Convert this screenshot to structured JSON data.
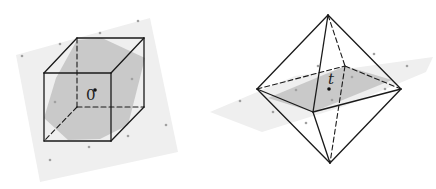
{
  "figure": {
    "width": 436,
    "height": 189,
    "colors": {
      "edge": "#1a1a1a",
      "plane": "#efefef",
      "section": "#c4c4c4",
      "lattice_point": "#a0a0a0",
      "center_point": "#111111"
    },
    "cube": {
      "label": "0",
      "label_pos": [
        86,
        100
      ],
      "center": [
        95,
        90
      ],
      "plane_polygon": [
        [
          16,
          55
        ],
        [
          150,
          18
        ],
        [
          178,
          152
        ],
        [
          40,
          182
        ]
      ],
      "section_polygon": [
        [
          77,
          40
        ],
        [
          102,
          38
        ],
        [
          145,
          58
        ],
        [
          128,
          125
        ],
        [
          100,
          139
        ],
        [
          68,
          140
        ],
        [
          44,
          118
        ],
        [
          56,
          78
        ]
      ],
      "solid_edges": [
        [
          [
            44,
            73
          ],
          [
            111,
            73
          ]
        ],
        [
          [
            111,
            73
          ],
          [
            111,
            141
          ]
        ],
        [
          [
            111,
            141
          ],
          [
            44,
            141
          ]
        ],
        [
          [
            44,
            141
          ],
          [
            44,
            73
          ]
        ],
        [
          [
            77,
            38
          ],
          [
            144,
            38
          ]
        ],
        [
          [
            144,
            38
          ],
          [
            144,
            107
          ]
        ],
        [
          [
            44,
            73
          ],
          [
            77,
            38
          ]
        ],
        [
          [
            111,
            73
          ],
          [
            144,
            38
          ]
        ],
        [
          [
            111,
            141
          ],
          [
            144,
            107
          ]
        ]
      ],
      "dashed_edges": [
        [
          [
            77,
            38
          ],
          [
            77,
            107
          ]
        ],
        [
          [
            77,
            107
          ],
          [
            144,
            107
          ]
        ],
        [
          [
            77,
            107
          ],
          [
            44,
            141
          ]
        ]
      ],
      "lattice_points": [
        [
          22,
          56
        ],
        [
          100,
          33
        ],
        [
          138,
          21
        ],
        [
          60,
          44
        ],
        [
          132,
          79
        ],
        [
          55,
          102
        ],
        [
          166,
          125
        ],
        [
          128,
          136
        ],
        [
          89,
          147
        ],
        [
          50,
          160
        ]
      ]
    },
    "octahedron": {
      "label": "t",
      "label_pos": [
        328,
        84
      ],
      "center": [
        329,
        89
      ],
      "plane_polygon": [
        [
          210,
          112
        ],
        [
          295,
          76
        ],
        [
          433,
          57
        ],
        [
          426,
          72
        ],
        [
          345,
          106
        ],
        [
          262,
          132
        ]
      ],
      "section_polygon": [
        [
          268,
          98
        ],
        [
          345,
          66
        ],
        [
          392,
          80
        ],
        [
          313,
          112
        ]
      ],
      "vertices": {
        "top": [
          328,
          15
        ],
        "bottom": [
          330,
          163
        ],
        "left": [
          257,
          89
        ],
        "right": [
          401,
          89
        ],
        "front": [
          313,
          112
        ],
        "back": [
          345,
          66
        ]
      },
      "solid_edges": [
        [
          [
            328,
            15
          ],
          [
            257,
            89
          ]
        ],
        [
          [
            328,
            15
          ],
          [
            401,
            89
          ]
        ],
        [
          [
            328,
            15
          ],
          [
            313,
            112
          ]
        ],
        [
          [
            330,
            163
          ],
          [
            257,
            89
          ]
        ],
        [
          [
            330,
            163
          ],
          [
            401,
            89
          ]
        ],
        [
          [
            330,
            163
          ],
          [
            313,
            112
          ]
        ],
        [
          [
            257,
            89
          ],
          [
            313,
            112
          ]
        ],
        [
          [
            313,
            112
          ],
          [
            401,
            89
          ]
        ]
      ],
      "dashed_edges": [
        [
          [
            257,
            89
          ],
          [
            345,
            66
          ]
        ],
        [
          [
            345,
            66
          ],
          [
            401,
            89
          ]
        ],
        [
          [
            328,
            15
          ],
          [
            345,
            66
          ]
        ],
        [
          [
            345,
            66
          ],
          [
            330,
            163
          ]
        ]
      ],
      "lattice_points": [
        [
          240,
          101
        ],
        [
          296,
          90
        ],
        [
          318,
          66
        ],
        [
          352,
          77
        ],
        [
          374,
          54
        ],
        [
          385,
          89
        ],
        [
          407,
          66
        ],
        [
          273,
          112
        ],
        [
          306,
          123
        ],
        [
          332,
          100
        ]
      ]
    }
  }
}
